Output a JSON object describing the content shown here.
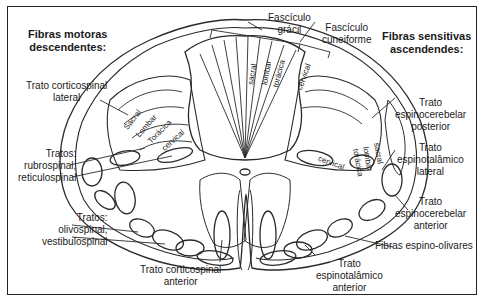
{
  "headings": {
    "motor": "Fibras motoras\ndescendentes:",
    "sensory": "Fibras sensitivas\nascendendes:"
  },
  "labels": {
    "fasciculo_gracil": "Fascículo\ngrácil",
    "fasciculo_cuneiforme": "Fascículo\ncuneiforme",
    "corticospinal_lateral": "Trato corticospinal\nlateral",
    "rubro_reticulo": "Tratos:\nrubrospinal,\nreticulospinal",
    "olivo_vestibulo": "Tratos:\nolivospinal,\nvestibulospinal",
    "corticospinal_anterior": "Trato corticospinal\nanterior",
    "espinocerebelar_posterior": "Trato\nespinocerebelar\nposterior",
    "espinotalamico_lateral": "Trato\nespinotalâmico\nlateral",
    "espinocerebelar_anterior": "Trato\nespinocerebelar\nanterior",
    "espino_olivares": "Fibras espino-olivares",
    "espinotalamico_anterior": "Trato\nespinotalâmico\nanterior"
  },
  "segments": {
    "dorsal": [
      "sacral",
      "lombar",
      "torácica",
      "cervical"
    ],
    "left_lateral": [
      "Sacral",
      "Lombar",
      "Torácica",
      "cervical"
    ],
    "right_lateral": [
      "cervical",
      "torácica",
      "lombar",
      "sacral"
    ]
  },
  "colors": {
    "line": "#2a2a2a",
    "border": "#222222",
    "background": "#ffffff"
  }
}
